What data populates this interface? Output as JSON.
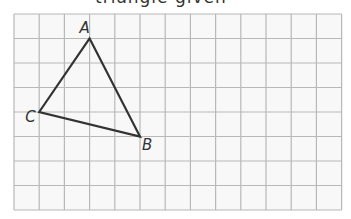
{
  "header": {
    "clipped_text": "triangle given"
  },
  "grid": {
    "columns": 13,
    "rows": 8,
    "origin_x": 14,
    "origin_y": 14,
    "cell_w": 25.2,
    "cell_h": 24.5,
    "line_color": "#b8b8b8",
    "background": "#f8f8f8"
  },
  "triangle": {
    "stroke_color": "#333333",
    "vertices": [
      {
        "name": "A",
        "col": 3,
        "row": 1
      },
      {
        "name": "B",
        "col": 5,
        "row": 5
      },
      {
        "name": "C",
        "col": 1,
        "row": 4
      }
    ]
  },
  "labels": {
    "A": "A",
    "B": "B",
    "C": "C"
  }
}
